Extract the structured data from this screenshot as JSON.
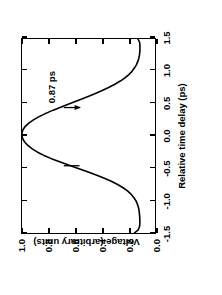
{
  "chart_data": {
    "type": "line",
    "title": "",
    "xlabel": "Relative time delay (ps)",
    "ylabel": "Voltage (arbitrary units)",
    "xlim": [
      -1.5,
      1.5
    ],
    "ylim": [
      0.0,
      1.0
    ],
    "grid": false,
    "legend": null,
    "xticks": [
      -1.5,
      -1.0,
      -0.5,
      0.0,
      0.5,
      1.0,
      1.5
    ],
    "xticklabels": [
      "-1.5",
      "-1.0",
      "-0.5",
      "0.0",
      "0.5",
      "1.0",
      "1.5"
    ],
    "yticks": [
      0.0,
      0.2,
      0.4,
      0.6,
      0.8,
      1.0
    ],
    "yticklabels": [
      "0.0",
      "0.2",
      "0.4",
      "0.6",
      "0.8",
      "1.0"
    ],
    "annotations": [
      {
        "text": "0.87 ps",
        "meaning": "pulse-width-fwhm",
        "x": 0.44,
        "y": 0.56
      }
    ],
    "markers": [
      {
        "name": "fwhm-marker-left",
        "x": -0.46,
        "y": 0.56
      },
      {
        "name": "fwhm-marker-right",
        "x": 0.44,
        "y": 0.56
      }
    ],
    "series": [
      {
        "name": "voltage-autocorrelation",
        "color": "#000000",
        "x": [
          -1.5,
          -1.45,
          -1.4,
          -1.35,
          -1.3,
          -1.25,
          -1.2,
          -1.15,
          -1.1,
          -1.05,
          -1.0,
          -0.95,
          -0.9,
          -0.85,
          -0.8,
          -0.75,
          -0.7,
          -0.65,
          -0.6,
          -0.55,
          -0.5,
          -0.45,
          -0.4,
          -0.35,
          -0.3,
          -0.25,
          -0.2,
          -0.15,
          -0.1,
          -0.05,
          0.0,
          0.05,
          0.1,
          0.15,
          0.2,
          0.25,
          0.3,
          0.35,
          0.4,
          0.45,
          0.5,
          0.55,
          0.6,
          0.65,
          0.7,
          0.75,
          0.8,
          0.85,
          0.9,
          0.95,
          1.0,
          1.05,
          1.1,
          1.15,
          1.2,
          1.25,
          1.3,
          1.35,
          1.4,
          1.45,
          1.5
        ],
        "y": [
          0.155,
          0.126,
          0.116,
          0.114,
          0.114,
          0.115,
          0.117,
          0.12,
          0.125,
          0.133,
          0.144,
          0.16,
          0.18,
          0.207,
          0.24,
          0.281,
          0.329,
          0.385,
          0.447,
          0.513,
          0.582,
          0.651,
          0.717,
          0.779,
          0.835,
          0.883,
          0.923,
          0.954,
          0.977,
          0.993,
          1.0,
          1.0,
          0.992,
          0.975,
          0.949,
          0.914,
          0.871,
          0.821,
          0.765,
          0.705,
          0.643,
          0.58,
          0.517,
          0.457,
          0.401,
          0.349,
          0.302,
          0.261,
          0.226,
          0.197,
          0.173,
          0.155,
          0.14,
          0.13,
          0.122,
          0.117,
          0.114,
          0.113,
          0.113,
          0.116,
          0.128
        ]
      }
    ]
  },
  "axes": {
    "x_title": "Relative time delay (ps)",
    "y_title": "Voltage (arbitrary units)"
  },
  "annotation": {
    "fwhm_label": "0.87 ps"
  }
}
